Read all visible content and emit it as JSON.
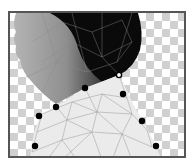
{
  "canvas": {
    "mode": "puppet-warp-mesh",
    "background": "transparency-checkerboard",
    "colors": {
      "frame": "#555555",
      "checker_dark": "#d0d0d0",
      "checker_light": "#ffffff",
      "hair": "#0a0a0a",
      "skin": "#9a9a9a",
      "shirt": "#ebebeb",
      "mesh_line": "#8a8a8a",
      "pin": "#000000"
    },
    "pins": [
      {
        "id": "pin-1",
        "x": 117,
        "y": 73,
        "selected": true
      },
      {
        "id": "pin-2",
        "x": 83,
        "y": 86,
        "selected": false
      },
      {
        "id": "pin-3",
        "x": 121,
        "y": 92,
        "selected": false
      },
      {
        "id": "pin-4",
        "x": 54,
        "y": 105,
        "selected": false
      },
      {
        "id": "pin-5",
        "x": 37,
        "y": 114,
        "selected": false
      },
      {
        "id": "pin-6",
        "x": 140,
        "y": 119,
        "selected": false
      },
      {
        "id": "pin-7",
        "x": 33,
        "y": 144,
        "selected": false
      },
      {
        "id": "pin-8",
        "x": 154,
        "y": 144,
        "selected": false
      }
    ]
  }
}
